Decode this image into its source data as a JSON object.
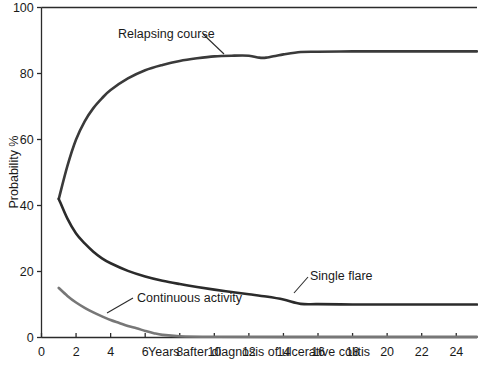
{
  "chart_data": {
    "type": "line",
    "title": "",
    "subtitle": "",
    "xlabel": "Years after diagnosis of ulcerative colitis",
    "ylabel": "Probability %",
    "xlim": [
      0,
      25.2
    ],
    "ylim": [
      0,
      100
    ],
    "xticks": [
      0,
      2,
      4,
      6,
      8,
      10,
      12,
      14,
      16,
      18,
      20,
      22,
      24
    ],
    "yticks": [
      0,
      20,
      40,
      60,
      80,
      100
    ],
    "xtick_labels": [
      "0",
      "2",
      "4",
      "6",
      "8",
      "10",
      "12",
      "14",
      "16",
      "18",
      "20",
      "22",
      "24"
    ],
    "ytick_labels": [
      "0",
      "20",
      "40",
      "60",
      "80",
      "100"
    ],
    "grid": false,
    "legend": "inline-annotations",
    "series": [
      {
        "name": "Relapsing course",
        "color": "#3a3a3a",
        "linewidth": 2.6,
        "annotation": "Relapsing course",
        "x": [
          1,
          1.5,
          2,
          2.5,
          3,
          3.5,
          4,
          5,
          6,
          7,
          8,
          9,
          10,
          11,
          12,
          12.6,
          13,
          13.6,
          14,
          15,
          16,
          18,
          20,
          22,
          25.2
        ],
        "y": [
          42,
          52,
          60,
          65.5,
          69.5,
          72.5,
          75,
          78.5,
          81,
          82.6,
          83.8,
          84.6,
          85.2,
          85.4,
          85.4,
          84.8,
          84.8,
          85.4,
          85.8,
          86.5,
          86.6,
          86.7,
          86.7,
          86.7,
          86.7
        ]
      },
      {
        "name": "Single flare",
        "color": "#2b2b2b",
        "linewidth": 2.6,
        "annotation": "Single flare",
        "x": [
          1,
          1.5,
          2,
          2.5,
          3,
          3.5,
          4,
          5,
          6,
          7,
          8,
          9,
          10,
          11,
          12,
          13,
          14,
          15,
          16,
          18,
          20,
          22,
          25.2
        ],
        "y": [
          42,
          36,
          31.5,
          28.5,
          26,
          24,
          22.5,
          20.2,
          18.5,
          17.2,
          16.2,
          15.3,
          14.5,
          13.8,
          13.1,
          12.4,
          11.5,
          10.2,
          10.1,
          10.0,
          10.0,
          10.0,
          10.0
        ]
      },
      {
        "name": "Continuous activity",
        "color": "#777777",
        "linewidth": 2.6,
        "annotation": "Continuous activity",
        "x": [
          1,
          1.5,
          2,
          2.5,
          3,
          3.5,
          4,
          4.5,
          5,
          5.5,
          6,
          6.5,
          7,
          8,
          10,
          14,
          20,
          25.2
        ],
        "y": [
          15,
          12.6,
          10.6,
          9.0,
          7.6,
          6.4,
          5.3,
          4.4,
          3.5,
          2.8,
          2.0,
          1.3,
          0.8,
          0.4,
          0.25,
          0.2,
          0.2,
          0.2
        ]
      }
    ],
    "annotations": [
      {
        "label": "Relapsing course",
        "leader_from": [
          203,
          34
        ],
        "leader_to": [
          224,
          54
        ]
      },
      {
        "label": "Continuous activity",
        "leader_from": [
          133,
          298
        ],
        "leader_to": [
          107,
          313
        ]
      },
      {
        "label": "Single flare",
        "leader_from": [
          308,
          277
        ],
        "leader_to": [
          294,
          293
        ]
      }
    ],
    "axis_color": "#2b2b2b",
    "background": "#ffffff"
  }
}
